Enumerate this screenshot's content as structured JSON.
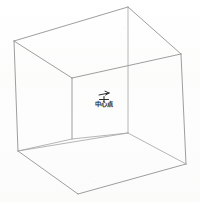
{
  "figure": {
    "kind": "line-drawing",
    "center_label": "中心点",
    "marker_icon": "cross-marker-icon",
    "leader_icon": "leader-line-icon",
    "colors": {
      "background": "#fdfdfc",
      "edge_visible": "#8d8d8d",
      "edge_hidden": "#a3a3a3",
      "annotation": "#2e2e2e"
    },
    "vertices": {
      "top_back": [
        128,
        7
      ],
      "top_left": [
        14,
        41
      ],
      "top_right": [
        181,
        54
      ],
      "top_front": [
        72,
        78
      ],
      "bottom_back": [
        128,
        133
      ],
      "bottom_left": [
        18,
        151
      ],
      "bottom_right": [
        186,
        164
      ],
      "bottom_front": [
        78,
        194
      ],
      "inner_bottom": [
        72,
        139
      ]
    },
    "marker": {
      "center_x": 104,
      "center_y": 101,
      "arm": 4.5
    },
    "label_position": {
      "x": 104,
      "y": 106
    }
  }
}
